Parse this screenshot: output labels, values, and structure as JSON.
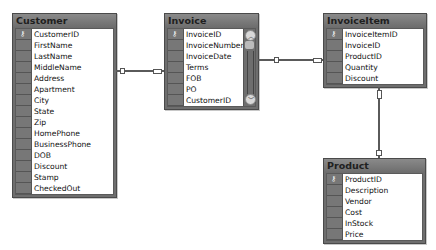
{
  "tables": [
    {
      "name": "Customer",
      "key_icon": "key-icon",
      "columns": [
        "CustomerID",
        "FirstName",
        "LastName",
        "MiddleName",
        "Address",
        "Apartment",
        "City",
        "State",
        "Zip",
        "HomePhone",
        "BusinessPhone",
        "DOB",
        "Discount",
        "Stamp",
        "CheckedOut"
      ],
      "primary_key": "CustomerID"
    },
    {
      "name": "Invoice",
      "key_icon": "key-icon",
      "columns": [
        "InvoiceID",
        "InvoiceNumber",
        "InvoiceDate",
        "Terms",
        "FOB",
        "PO",
        "CustomerID"
      ],
      "primary_key": "InvoiceID",
      "has_scrollbar": true
    },
    {
      "name": "InvoiceItem",
      "key_icon": "key-icon",
      "columns": [
        "InvoiceItemID",
        "InvoiceID",
        "ProductID",
        "Quantity",
        "Discount"
      ],
      "primary_key": "InvoiceItemID"
    },
    {
      "name": "Product",
      "key_icon": "key-icon",
      "columns": [
        "ProductID",
        "Description",
        "Vendor",
        "Cost",
        "InStock",
        "Price"
      ],
      "primary_key": "ProductID"
    }
  ],
  "relationships": [
    {
      "from": "Customer",
      "to": "Invoice"
    },
    {
      "from": "Invoice",
      "to": "InvoiceItem"
    },
    {
      "from": "InvoiceItem",
      "to": "Product"
    }
  ],
  "icons": {
    "key": "⚷",
    "scroll_up": "︿",
    "scroll_down": "﹀"
  }
}
